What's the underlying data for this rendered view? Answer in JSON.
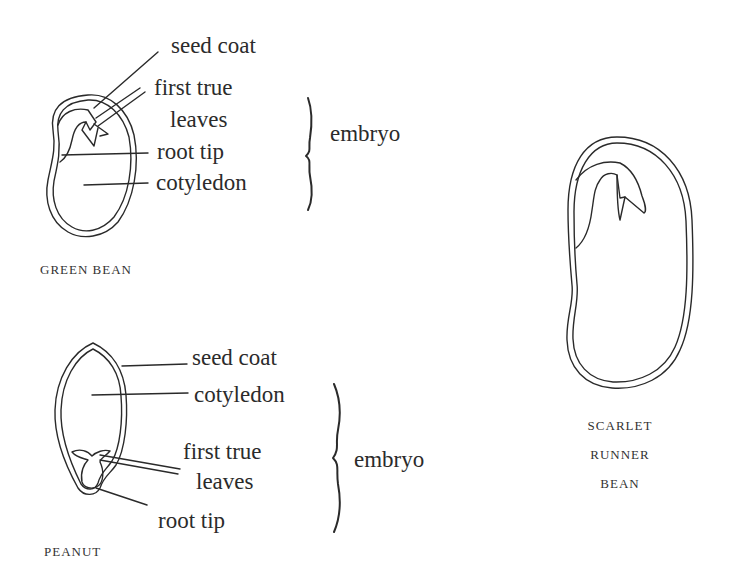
{
  "figures": [
    {
      "name": "green-bean",
      "caption": "GREEN BEAN",
      "labels": {
        "seed_coat": "seed coat",
        "first_true_leaves_1": "first true",
        "first_true_leaves_2": "leaves",
        "root_tip": "root tip",
        "cotyledon": "cotyledon"
      },
      "bracket_label": "embryo"
    },
    {
      "name": "peanut",
      "caption": "PEANUT",
      "labels": {
        "seed_coat": "seed coat",
        "cotyledon": "cotyledon",
        "first_true_leaves_1": "first true",
        "first_true_leaves_2": "leaves",
        "root_tip": "root tip"
      },
      "bracket_label": "embryo"
    },
    {
      "name": "scarlet-runner-bean",
      "caption_lines": [
        "SCARLET",
        "RUNNER",
        "BEAN"
      ]
    }
  ]
}
